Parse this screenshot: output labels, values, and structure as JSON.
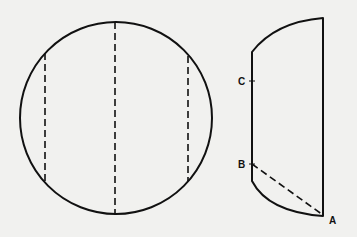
{
  "figure": {
    "stroke_color": "#111111",
    "background": "#f1f1ef",
    "labels": {
      "a": "A",
      "b": "B",
      "c": "C"
    },
    "circle": {
      "cx": 116,
      "cy": 118,
      "r": 96
    },
    "dashed_chords_x": [
      45,
      115,
      188
    ],
    "side_view": {
      "left_edge_x": 252,
      "right_edge_x": 323,
      "top_left_y": 52,
      "top_right_y": 18,
      "bottom_left_y": 181,
      "bottom_right_y": 216,
      "point_c_y": 81,
      "point_b_y": 163
    }
  }
}
